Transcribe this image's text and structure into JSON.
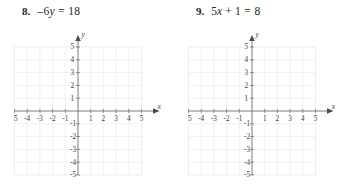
{
  "page": {
    "background_color": "#ffffff",
    "text_color": "#231f20"
  },
  "problems": [
    {
      "number": "8.",
      "equation": {
        "full_text": "-6y = 18",
        "lead_minus": "–",
        "coefficient": "6",
        "variable": "y",
        "equals": "=",
        "right_side": "18"
      },
      "graph": {
        "x_axis_label": "x",
        "y_axis_label": "y",
        "x_tick_labels_negative": [
          "-5",
          "-4",
          "-3",
          "-2",
          "-1"
        ],
        "x_tick_labels_positive": [
          "1",
          "2",
          "3",
          "4",
          "5"
        ],
        "y_tick_labels_positive": [
          "1",
          "2",
          "3",
          "4",
          "5"
        ],
        "y_tick_labels_negative": [
          "-1",
          "-2",
          "-3",
          "-4",
          "-5"
        ],
        "x_min": -5,
        "x_max": 5,
        "y_min": -5,
        "y_max": 5,
        "grid_color": "#ededf0",
        "axis_color": "#6d6d72",
        "plotted_points": [],
        "plotted_line": null
      }
    },
    {
      "number": "9.",
      "equation": {
        "full_text": "5x + 1 = 8",
        "lead_minus": "",
        "coefficient": "5",
        "variable": "x",
        "operator": "+",
        "constant": "1",
        "equals": "=",
        "right_side": "8"
      },
      "graph": {
        "x_axis_label": "x",
        "y_axis_label": "y",
        "x_tick_labels_negative": [
          "-5",
          "-4",
          "-3",
          "-2",
          "-1"
        ],
        "x_tick_labels_positive": [
          "1",
          "2",
          "3",
          "4",
          "5"
        ],
        "y_tick_labels_positive": [
          "1",
          "2",
          "3",
          "4",
          "5"
        ],
        "y_tick_labels_negative": [
          "-1",
          "-2",
          "-3",
          "-4",
          "-5"
        ],
        "x_min": -5,
        "x_max": 5,
        "y_min": -5,
        "y_max": 5,
        "grid_color": "#ededf0",
        "axis_color": "#6d6d72",
        "plotted_points": [],
        "plotted_line": null
      }
    }
  ]
}
